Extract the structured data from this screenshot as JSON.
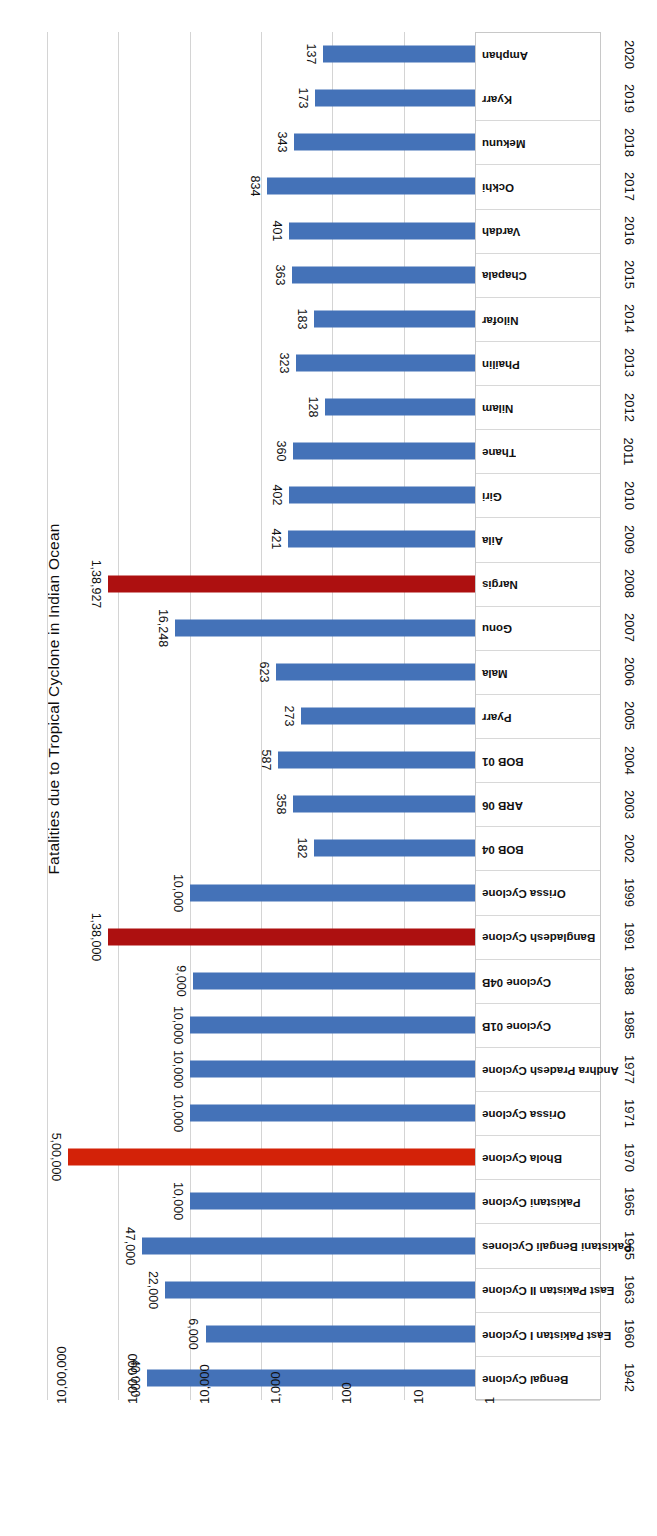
{
  "chart_data": {
    "type": "bar",
    "orientation": "horizontal",
    "title": "Fatalities due to Tropical Cyclone in Indian Ocean",
    "xlabel": "",
    "ylabel": "",
    "scale": "log",
    "grid": true,
    "legend": "none",
    "axis_ticks": [
      "10,00,000",
      "1,00,000",
      "10,000",
      "1,000",
      "100",
      "10",
      "1"
    ],
    "axis_tick_values": [
      1000000,
      100000,
      10000,
      1000,
      100,
      10,
      1
    ],
    "xlim": [
      1,
      1000000
    ],
    "colors": {
      "bar": "#4472b8",
      "highlight_dark_red": "#ad1010",
      "highlight_bright_red": "#d32208",
      "gridline": "#d4d4d4",
      "text": "#111111",
      "background": "#ffffff"
    },
    "categories": [
      "Bengal Cyclone",
      "East Pakistan I Cyclone",
      "East Pakistan II Cyclone",
      "Pakistani Bengali Cyclones",
      "Pakistani Cyclone",
      "Bhola Cyclone",
      "Orissa Cyclone",
      "Andhra Pradesh Cyclone",
      "Cyclone 01B",
      "Cyclone 04B",
      "Bangladesh Cyclone",
      "Orissa Cyclone",
      "BOB 04",
      "ARB 06",
      "BOB 01",
      "Pyarr",
      "Mala",
      "Gonu",
      "Nargis",
      "Aila",
      "Giri",
      "Thane",
      "Nilam",
      "Phailin",
      "Nilofar",
      "Chapala",
      "Vardah",
      "Ockhi",
      "Mekunu",
      "Kyarr",
      "Amphan"
    ],
    "years": [
      "1942",
      "1960",
      "1963",
      "1965",
      "1965",
      "1970",
      "1971",
      "1977",
      "1985",
      "1988",
      "1991",
      "1999",
      "2002",
      "2003",
      "2004",
      "2005",
      "2006",
      "2007",
      "2008",
      "2009",
      "2010",
      "2011",
      "2012",
      "2013",
      "2014",
      "2015",
      "2016",
      "2017",
      "2018",
      "2019",
      "2020"
    ],
    "values": [
      40000,
      6000,
      22000,
      47000,
      10000,
      500000,
      10000,
      10000,
      10000,
      9000,
      138000,
      10000,
      182,
      358,
      587,
      273,
      623,
      16248,
      138927,
      421,
      402,
      360,
      128,
      323,
      183,
      363,
      401,
      834,
      343,
      173,
      137
    ],
    "value_labels": [
      "40,000",
      "6,000",
      "22,000",
      "47,000",
      "10,000",
      "5,00,000",
      "10,000",
      "10,000",
      "10,000",
      "9,000",
      "1,38,000",
      "10,000",
      "182",
      "358",
      "587",
      "273",
      "623",
      "16,248",
      "1,38,927",
      "421",
      "402",
      "360",
      "128",
      "323",
      "183",
      "363",
      "401",
      "834",
      "343",
      "173",
      "137"
    ],
    "highlighted": [
      false,
      false,
      false,
      false,
      false,
      "bright",
      false,
      false,
      false,
      false,
      "dark",
      false,
      false,
      false,
      false,
      false,
      false,
      false,
      "dark",
      false,
      false,
      false,
      false,
      false,
      false,
      false,
      false,
      false,
      false,
      false,
      false
    ]
  }
}
